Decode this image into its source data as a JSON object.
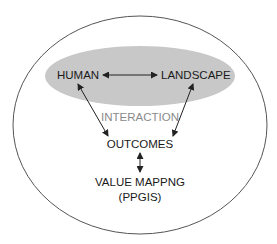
{
  "diagram": {
    "nodes": {
      "human": "HUMAN",
      "landscape": "LANDSCAPE",
      "interaction": "INTERACTION",
      "outcomes": "OUTCOMES",
      "value_mapping": "VALUE MAPPNG",
      "ppgis": "(PPGIS)"
    },
    "edges": [
      {
        "from": "HUMAN",
        "to": "LANDSCAPE",
        "type": "bidirectional"
      },
      {
        "from": "HUMAN",
        "to": "OUTCOMES",
        "type": "bidirectional"
      },
      {
        "from": "LANDSCAPE",
        "to": "OUTCOMES",
        "type": "bidirectional"
      },
      {
        "from": "OUTCOMES",
        "to": "VALUE MAPPNG (PPGIS)",
        "type": "bidirectional"
      }
    ],
    "colors": {
      "outer_ellipse_stroke": "#555555",
      "inner_ellipse_fill": "#c8c8c8",
      "text": "#1a1a1a",
      "interaction_text": "#8a8a8a"
    }
  }
}
